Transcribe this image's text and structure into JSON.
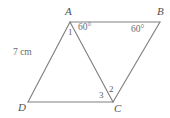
{
  "figure": {
    "type": "parallelogram-with-diagonal",
    "stroke_color": "#808082",
    "label_color": "#58595b",
    "background": "#ffffff",
    "vertices": [
      {
        "name": "A",
        "label": "A",
        "x": 70,
        "y": 22
      },
      {
        "name": "B",
        "label": "B",
        "x": 160,
        "y": 22
      },
      {
        "name": "C",
        "label": "C",
        "x": 113,
        "y": 102
      },
      {
        "name": "D",
        "label": "D",
        "x": 28,
        "y": 102
      }
    ],
    "edges": [
      {
        "name": "side-AB",
        "from": "A",
        "to": "B"
      },
      {
        "name": "side-BC",
        "from": "B",
        "to": "C"
      },
      {
        "name": "side-CD",
        "from": "C",
        "to": "D"
      },
      {
        "name": "side-DA",
        "from": "D",
        "to": "A"
      },
      {
        "name": "diagonal-AC",
        "from": "A",
        "to": "C"
      }
    ],
    "vertex_labels": {
      "A": "A",
      "B": "B",
      "C": "C",
      "D": "D"
    },
    "angle_labels": {
      "angle_1_at_A": "1",
      "angle_DAB_right_part": "60°",
      "angle_B": "60°",
      "angle_2_at_C": "2",
      "angle_3_at_C": "3"
    },
    "side_labels": {
      "AD": "7 cm"
    }
  }
}
